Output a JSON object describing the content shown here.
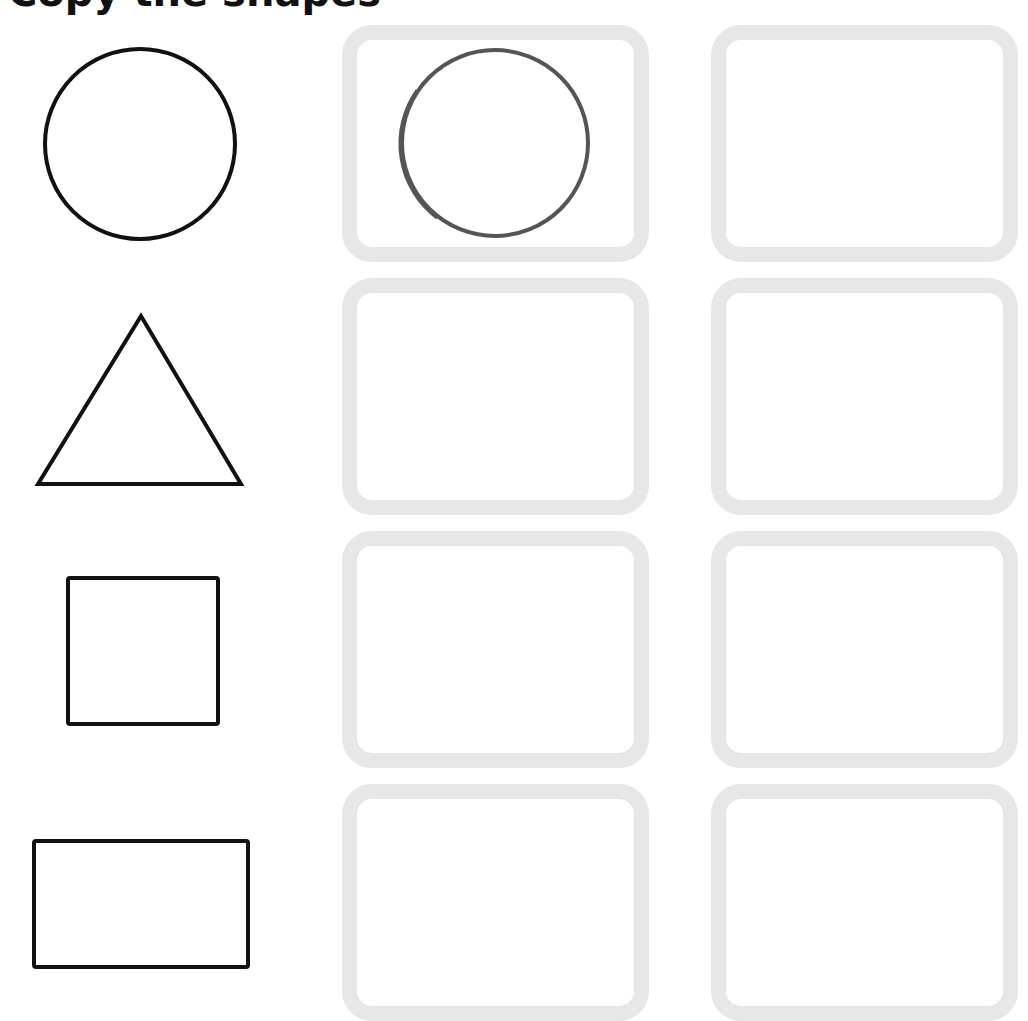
{
  "worksheet": {
    "title_visible_fragment": "Copy the shapes",
    "colors": {
      "model_stroke": "#111111",
      "traced_stroke": "#555555",
      "box_border": "#e7e7e7",
      "background": "#ffffff"
    },
    "rows": [
      {
        "model_shape": "circle",
        "box1_content": "circle-drawing",
        "box2_content": "empty"
      },
      {
        "model_shape": "triangle",
        "box1_content": "empty",
        "box2_content": "empty"
      },
      {
        "model_shape": "square",
        "box1_content": "empty",
        "box2_content": "empty"
      },
      {
        "model_shape": "rectangle",
        "box1_content": "empty",
        "box2_content": "empty"
      }
    ]
  }
}
